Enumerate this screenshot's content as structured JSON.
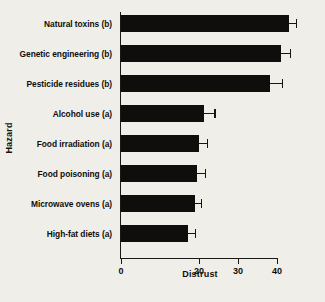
{
  "chart_data": {
    "type": "bar",
    "orientation": "horizontal",
    "title": "",
    "xlabel": "Distrust",
    "ylabel": "Hazard",
    "categories": [
      "Natural toxins (b)",
      "Genetic engineering (b)",
      "Pesticide residues (b)",
      "Alcohol use (a)",
      "Food irradiation (a)",
      "Food poisoning (a)",
      "Microwave ovens (a)",
      "High-fat diets (a)"
    ],
    "values": [
      43.0,
      41.0,
      38.3,
      21.2,
      20.0,
      19.5,
      19.0,
      17.3
    ],
    "errors_upper": [
      2.2,
      2.6,
      3.2,
      3.0,
      2.2,
      2.2,
      1.8,
      2.0
    ],
    "xlim": [
      0,
      40.5
    ],
    "xticks": [
      0,
      20,
      30,
      40
    ],
    "xticklabels": [
      "0",
      "20",
      "30",
      "40"
    ],
    "grid": false,
    "legend": false,
    "bar_color": "#100e0c",
    "background_color": "#efeee9",
    "axis_color": "#1a1814"
  }
}
